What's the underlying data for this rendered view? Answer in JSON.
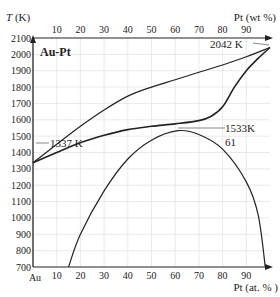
{
  "chart_data": {
    "type": "line",
    "title": "Au-Pt",
    "ylabel": "T (K)",
    "xlabel_bottom": "Pt (at. % )",
    "xlabel_top": "Pt (wt %)",
    "xlim": [
      0,
      100
    ],
    "ylim": [
      700,
      2100
    ],
    "grid": true,
    "y_ticks": [
      "700",
      "800",
      "900",
      "1000",
      "1100",
      "1200",
      "1300",
      "1400",
      "1500",
      "1600",
      "1700",
      "1800",
      "1900",
      "2000",
      "2100"
    ],
    "x_ticks_bottom": [
      "Au",
      "10",
      "20",
      "30",
      "40",
      "50",
      "60",
      "70",
      "80",
      "90"
    ],
    "x_ticks_top": [
      "10",
      "20",
      "30",
      "40",
      "50",
      "60",
      "70",
      "80",
      "90"
    ],
    "series": [
      {
        "name": "liquidus",
        "x": [
          0,
          10,
          20,
          30,
          40,
          50,
          60,
          70,
          80,
          90,
          100
        ],
        "y": [
          1337,
          1450,
          1560,
          1660,
          1745,
          1800,
          1845,
          1890,
          1935,
          1985,
          2042
        ]
      },
      {
        "name": "solidus",
        "x": [
          0,
          10,
          20,
          30,
          40,
          50,
          60,
          70,
          75,
          80,
          85,
          90,
          95,
          100
        ],
        "y": [
          1337,
          1400,
          1460,
          1505,
          1540,
          1560,
          1575,
          1595,
          1620,
          1680,
          1800,
          1900,
          1975,
          2042
        ]
      },
      {
        "name": "miscibility gap",
        "x": [
          15,
          20,
          30,
          40,
          50,
          61,
          70,
          80,
          90,
          95,
          98
        ],
        "y": [
          700,
          900,
          1165,
          1360,
          1475,
          1533,
          1510,
          1420,
          1220,
          1020,
          700
        ]
      }
    ],
    "annotations": [
      {
        "text": "1337 K",
        "x": 0,
        "y": 1337
      },
      {
        "text": "2042 K",
        "x": 100,
        "y": 2042
      },
      {
        "text": "1533K",
        "x": 61,
        "y": 1533
      },
      {
        "text": "61",
        "x": 61,
        "y": 1533
      }
    ]
  },
  "labels": {
    "title": "Au-Pt",
    "ylabel": "T (K)",
    "xlabel_bottom": "Pt (at. % )",
    "xlabel_top": "Pt (wt %)",
    "anno_melt_au": "1337 K",
    "anno_melt_pt": "2042 K",
    "anno_gap_temp": "1533K",
    "anno_gap_comp": "61"
  }
}
